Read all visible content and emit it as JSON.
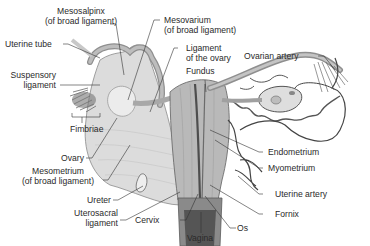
{
  "diagram": {
    "labels": {
      "mesosalpinx_1": "Mesosalpinx",
      "mesosalpinx_2": "(of broad ligament)",
      "mesovarium_1": "Mesovarium",
      "mesovarium_2": "(of broad ligament)",
      "uterine_tube": "Uterine tube",
      "ligament_ovary_1": "Ligament",
      "ligament_ovary_2": "of the ovary",
      "ovarian_artery": "Ovarian artery",
      "fundus": "Fundus",
      "suspensory_1": "Suspensory",
      "suspensory_2": "ligament",
      "fimbriae": "Fimbriae",
      "ovary": "Ovary",
      "endometrium": "Endometrium",
      "mesometrium_1": "Mesometrium",
      "mesometrium_2": "(of broad ligament)",
      "myometrium": "Myometrium",
      "ureter": "Ureter",
      "uterine_artery": "Uterine artery",
      "uterosacral_1": "Uterosacral",
      "uterosacral_2": "ligament",
      "cervix": "Cervix",
      "fornix": "Fornix",
      "os": "Os",
      "vagina": "Vagina"
    },
    "colors": {
      "tissue_light": "#d9d9d9",
      "tissue_mid": "#b5b5b5",
      "tissue_dark": "#7a7a7a",
      "vessel": "#4a4a4a",
      "leader": "#333333",
      "text": "#2a2a2a"
    }
  }
}
